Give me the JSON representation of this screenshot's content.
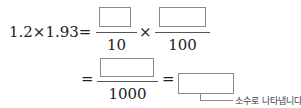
{
  "equation": {
    "lhs": "1.2×1.93=",
    "fraction1": {
      "numerator": "",
      "denominator": "10"
    },
    "times": "×",
    "fraction2": {
      "numerator": "",
      "denominator": "100"
    },
    "eq2": "=",
    "fraction3": {
      "numerator": "",
      "denominator": "1000"
    },
    "eq3": "=",
    "answer": "",
    "note": "소수로 나타냅니다."
  }
}
